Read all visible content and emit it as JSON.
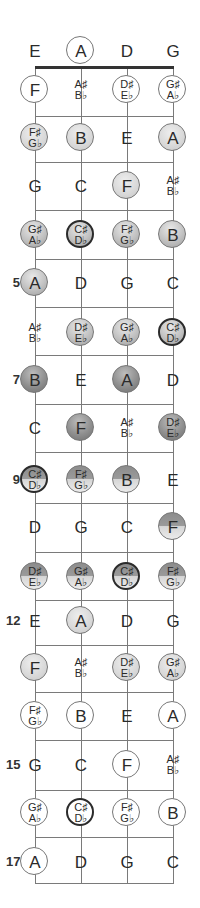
{
  "diagram": {
    "type": "fretboard",
    "strings": [
      "E",
      "A",
      "D",
      "G"
    ],
    "string_x": [
      35,
      81,
      127,
      173
    ],
    "nut_y": 67,
    "fret_line_y": [
      116,
      162,
      210,
      259,
      307,
      355,
      404,
      452,
      503,
      552,
      600,
      645,
      692,
      740,
      790,
      837,
      883
    ],
    "row_y": [
      51,
      90,
      138,
      186,
      235,
      283,
      333,
      380,
      428,
      480,
      527,
      577,
      621,
      668,
      716,
      765,
      813,
      862
    ],
    "fret_markers": [
      {
        "row": 5,
        "label": "5"
      },
      {
        "row": 7,
        "label": "7"
      },
      {
        "row": 9,
        "label": "9"
      },
      {
        "row": 12,
        "label": "12"
      },
      {
        "row": 15,
        "label": "15"
      },
      {
        "row": 17,
        "label": "17"
      }
    ],
    "rows": [
      [
        {
          "n": [
            "E"
          ],
          "s": "none"
        },
        {
          "n": [
            "A"
          ],
          "s": "outline"
        },
        {
          "n": [
            "D"
          ],
          "s": "none"
        },
        {
          "n": [
            "G"
          ],
          "s": "none"
        }
      ],
      [
        {
          "n": [
            "F"
          ],
          "s": "outline"
        },
        {
          "n": [
            "A♯",
            "B♭"
          ],
          "s": "none"
        },
        {
          "n": [
            "D♯",
            "E♭"
          ],
          "s": "outline"
        },
        {
          "n": [
            "G♯",
            "A♭"
          ],
          "s": "outline"
        }
      ],
      [
        {
          "n": [
            "F♯",
            "G♭"
          ],
          "s": "light"
        },
        {
          "n": [
            "B"
          ],
          "s": "light"
        },
        {
          "n": [
            "E"
          ],
          "s": "none"
        },
        {
          "n": [
            "A"
          ],
          "s": "light"
        }
      ],
      [
        {
          "n": [
            "G"
          ],
          "s": "none"
        },
        {
          "n": [
            "C"
          ],
          "s": "none"
        },
        {
          "n": [
            "F"
          ],
          "s": "light"
        },
        {
          "n": [
            "A♯",
            "B♭"
          ],
          "s": "none"
        }
      ],
      [
        {
          "n": [
            "G♯",
            "A♭"
          ],
          "s": "mid"
        },
        {
          "n": [
            "C♯",
            "D♭"
          ],
          "s": "mid",
          "root": true
        },
        {
          "n": [
            "F♯",
            "G♭"
          ],
          "s": "mid"
        },
        {
          "n": [
            "B"
          ],
          "s": "mid"
        }
      ],
      [
        {
          "n": [
            "A"
          ],
          "s": "mid"
        },
        {
          "n": [
            "D"
          ],
          "s": "none"
        },
        {
          "n": [
            "G"
          ],
          "s": "none"
        },
        {
          "n": [
            "C"
          ],
          "s": "none"
        }
      ],
      [
        {
          "n": [
            "A♯",
            "B♭"
          ],
          "s": "none"
        },
        {
          "n": [
            "D♯",
            "E♭"
          ],
          "s": "mid"
        },
        {
          "n": [
            "G♯",
            "A♭"
          ],
          "s": "mid"
        },
        {
          "n": [
            "C♯",
            "D♭"
          ],
          "s": "mid",
          "root": true
        }
      ],
      [
        {
          "n": [
            "B"
          ],
          "s": "dark"
        },
        {
          "n": [
            "E"
          ],
          "s": "none"
        },
        {
          "n": [
            "A"
          ],
          "s": "dark"
        },
        {
          "n": [
            "D"
          ],
          "s": "none"
        }
      ],
      [
        {
          "n": [
            "C"
          ],
          "s": "none"
        },
        {
          "n": [
            "F"
          ],
          "s": "dark"
        },
        {
          "n": [
            "A♯",
            "B♭"
          ],
          "s": "none"
        },
        {
          "n": [
            "D♯",
            "E♭"
          ],
          "s": "dark"
        }
      ],
      [
        {
          "n": [
            "C♯",
            "D♭"
          ],
          "s": "split",
          "root": true
        },
        {
          "n": [
            "F♯",
            "G♭"
          ],
          "s": "split"
        },
        {
          "n": [
            "B"
          ],
          "s": "split"
        },
        {
          "n": [
            "E"
          ],
          "s": "none"
        }
      ],
      [
        {
          "n": [
            "D"
          ],
          "s": "none"
        },
        {
          "n": [
            "G"
          ],
          "s": "none"
        },
        {
          "n": [
            "C"
          ],
          "s": "none"
        },
        {
          "n": [
            "F"
          ],
          "s": "split"
        }
      ],
      [
        {
          "n": [
            "D♯",
            "E♭"
          ],
          "s": "split"
        },
        {
          "n": [
            "G♯",
            "A♭"
          ],
          "s": "split"
        },
        {
          "n": [
            "C♯",
            "D♭"
          ],
          "s": "split",
          "root": true
        },
        {
          "n": [
            "F♯",
            "G♭"
          ],
          "s": "split"
        }
      ],
      [
        {
          "n": [
            "E"
          ],
          "s": "none"
        },
        {
          "n": [
            "A"
          ],
          "s": "light"
        },
        {
          "n": [
            "D"
          ],
          "s": "none"
        },
        {
          "n": [
            "G"
          ],
          "s": "none"
        }
      ],
      [
        {
          "n": [
            "F"
          ],
          "s": "light"
        },
        {
          "n": [
            "A♯",
            "B♭"
          ],
          "s": "none"
        },
        {
          "n": [
            "D♯",
            "E♭"
          ],
          "s": "light"
        },
        {
          "n": [
            "G♯",
            "A♭"
          ],
          "s": "light"
        }
      ],
      [
        {
          "n": [
            "F♯",
            "G♭"
          ],
          "s": "outline"
        },
        {
          "n": [
            "B"
          ],
          "s": "outline"
        },
        {
          "n": [
            "E"
          ],
          "s": "none"
        },
        {
          "n": [
            "A"
          ],
          "s": "outline"
        }
      ],
      [
        {
          "n": [
            "G"
          ],
          "s": "none"
        },
        {
          "n": [
            "C"
          ],
          "s": "none"
        },
        {
          "n": [
            "F"
          ],
          "s": "outline"
        },
        {
          "n": [
            "A♯",
            "B♭"
          ],
          "s": "none"
        }
      ],
      [
        {
          "n": [
            "G♯",
            "A♭"
          ],
          "s": "outline"
        },
        {
          "n": [
            "C♯",
            "D♭"
          ],
          "s": "outline",
          "root": true
        },
        {
          "n": [
            "F♯",
            "G♭"
          ],
          "s": "outline"
        },
        {
          "n": [
            "B"
          ],
          "s": "outline"
        }
      ],
      [
        {
          "n": [
            "A"
          ],
          "s": "outline"
        },
        {
          "n": [
            "D"
          ],
          "s": "none"
        },
        {
          "n": [
            "G"
          ],
          "s": "none"
        },
        {
          "n": [
            "C"
          ],
          "s": "none"
        }
      ]
    ],
    "colors": {
      "line": "#7a7a7a",
      "nut": "#333333",
      "root_border": "#2b2b2b"
    }
  }
}
